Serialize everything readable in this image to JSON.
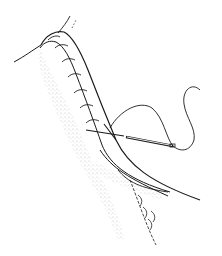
{
  "illustration": {
    "subject": "surgical suture needle passing through tissue flap",
    "colors": {
      "ink": "#1a1a1a",
      "stipple": "#777777",
      "background": "#ffffff"
    }
  }
}
